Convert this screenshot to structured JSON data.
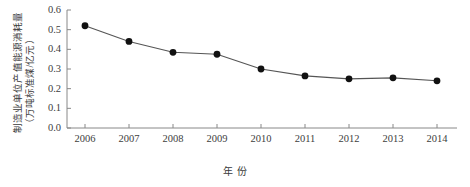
{
  "chart_data": {
    "type": "line",
    "title": "",
    "xlabel": "年  份",
    "ylabel": "制造业单位产值能源消耗量",
    "ylabel_sub": "（万吨标准煤/亿元）",
    "categories": [
      "2006",
      "2007",
      "2008",
      "2009",
      "2010",
      "2011",
      "2012",
      "2013",
      "2014"
    ],
    "values": [
      0.52,
      0.44,
      0.385,
      0.375,
      0.3,
      0.265,
      0.25,
      0.255,
      0.24
    ],
    "series": [
      {
        "name": "制造业单位产值能源消耗量",
        "values": [
          0.52,
          0.44,
          0.385,
          0.375,
          0.3,
          0.265,
          0.25,
          0.255,
          0.24
        ]
      }
    ],
    "ylim": [
      0.0,
      0.6
    ],
    "ytick_labels": [
      "0.0",
      "0.1",
      "0.2",
      "0.3",
      "0.4",
      "0.5",
      "0.6"
    ],
    "ytick_values": [
      0.0,
      0.1,
      0.2,
      0.3,
      0.4,
      0.5,
      0.6
    ],
    "xtick_labels": [
      "2006",
      "2007",
      "2008",
      "2009",
      "2010",
      "2011",
      "2012",
      "2013",
      "2014"
    ],
    "grid": false,
    "legend": "none",
    "marker": "filled-circle",
    "line_color": "#555555",
    "marker_color": "#111111",
    "axis_color": "#888888"
  }
}
